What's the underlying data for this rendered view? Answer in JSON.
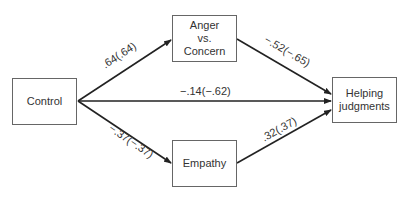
{
  "nodes": {
    "control": {
      "label": "Control"
    },
    "anger": {
      "line1": "Anger",
      "line2": "vs.",
      "line3": "Concern"
    },
    "empathy": {
      "label": "Empathy"
    },
    "helping": {
      "line1": "Helping",
      "line2": "judgments"
    }
  },
  "edges": {
    "control_anger": {
      "label": ".64(.64)"
    },
    "control_helping": {
      "label": "−.14(−.62)"
    },
    "control_empathy": {
      "label": "−.37(−.37)"
    },
    "anger_helping": {
      "label": "−.52(−.65)"
    },
    "empathy_helping": {
      "label": ".32(.37)"
    }
  },
  "colors": {
    "line": "#222222",
    "box_border": "#666666",
    "text": "#333333"
  }
}
